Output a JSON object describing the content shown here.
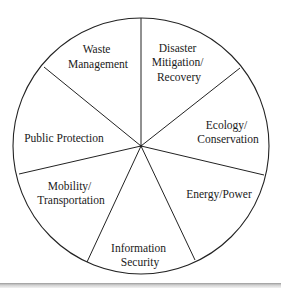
{
  "diagram": {
    "type": "pie-segmented-circle",
    "center": [
      141,
      146
    ],
    "radius": 129,
    "stroke_color": "#222222",
    "segments": [
      {
        "id": "waste",
        "lines": [
          "Waste",
          "Management"
        ]
      },
      {
        "id": "disaster",
        "lines": [
          "Disaster",
          "Mitigation/",
          "Recovery"
        ]
      },
      {
        "id": "ecology",
        "lines": [
          "Ecology/",
          "Conservation"
        ]
      },
      {
        "id": "energy",
        "lines": [
          "Energy/Power"
        ]
      },
      {
        "id": "infosec",
        "lines": [
          "Information",
          "Security"
        ]
      },
      {
        "id": "mobility",
        "lines": [
          "Mobility/",
          "Transportation"
        ]
      },
      {
        "id": "public",
        "lines": [
          "Public Protection"
        ]
      }
    ]
  }
}
